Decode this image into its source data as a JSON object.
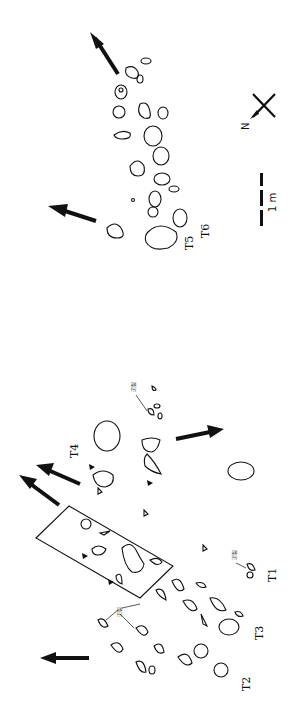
{
  "figure": {
    "type": "trackway-map",
    "orientation": "rotated-90-ccw",
    "colors": {
      "ink": "#111111",
      "background": "#ffffff"
    }
  },
  "labels": {
    "trackways": [
      {
        "id": "T1",
        "text": "T1"
      },
      {
        "id": "T2",
        "text": "T2"
      },
      {
        "id": "T3",
        "text": "T3"
      },
      {
        "id": "T4",
        "text": "T4"
      },
      {
        "id": "T5",
        "text": "T5"
      },
      {
        "id": "T6",
        "text": "T6"
      }
    ],
    "annotations": [
      {
        "id": "mudcrack-1",
        "text": "泥裂"
      },
      {
        "id": "mudcrack-2",
        "text": "泥裂"
      },
      {
        "id": "mudcrack-3",
        "text": "泥裂"
      }
    ],
    "scale_bar": {
      "text": "1 m"
    },
    "north_arrow": {
      "text": "N"
    }
  }
}
